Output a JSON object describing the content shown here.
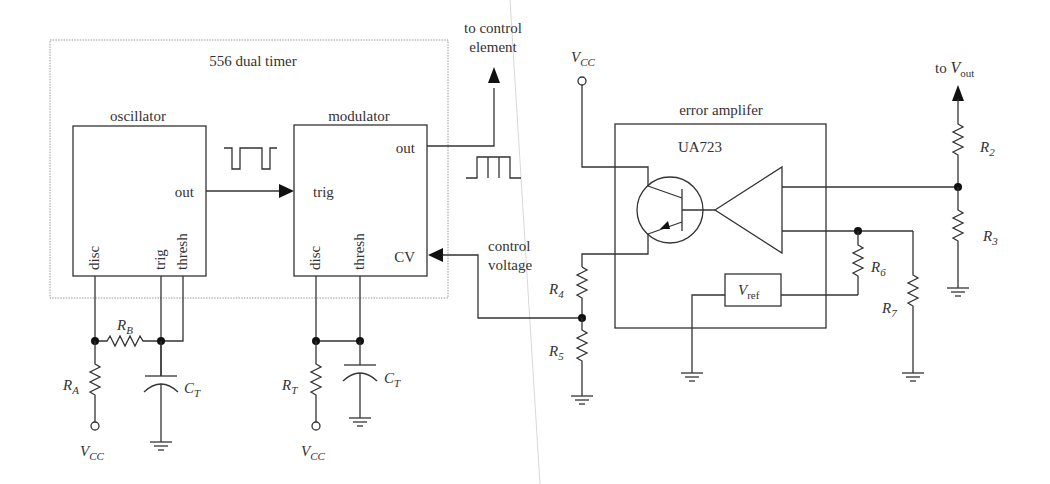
{
  "diagram": {
    "title": "556 dual timer",
    "blocks": {
      "oscillator": {
        "label": "oscillator",
        "pins": {
          "out": "out",
          "disc": "disc",
          "trig": "trig",
          "thresh": "thresh"
        }
      },
      "modulator": {
        "label": "modulator",
        "pins": {
          "out": "out",
          "trig": "trig",
          "disc": "disc",
          "thresh": "thresh",
          "cv": "CV"
        }
      },
      "error_amplifier": {
        "label": "error amplifer",
        "chip": "UA723",
        "vref": {
          "main": "V",
          "sub": "ref"
        }
      }
    },
    "annotations": {
      "to_control_line1": "to control",
      "to_control_line2": "element",
      "control_voltage_line1": "control",
      "control_voltage_line2": "voltage",
      "to_vout_prefix": "to",
      "vout_main": "V",
      "vout_sub": "out"
    },
    "components": {
      "RA": {
        "main": "R",
        "sub": "A"
      },
      "RB": {
        "main": "R",
        "sub": "B"
      },
      "CT1": {
        "main": "C",
        "sub": "T"
      },
      "RT": {
        "main": "R",
        "sub": "T"
      },
      "CT2": {
        "main": "C",
        "sub": "T"
      },
      "R2": {
        "main": "R",
        "sub": "2"
      },
      "R3": {
        "main": "R",
        "sub": "3"
      },
      "R4": {
        "main": "R",
        "sub": "4"
      },
      "R5": {
        "main": "R",
        "sub": "5"
      },
      "R6": {
        "main": "R",
        "sub": "6"
      },
      "R7": {
        "main": "R",
        "sub": "7"
      }
    },
    "supplies": {
      "vcc_osc": {
        "main": "V",
        "sub": "CC"
      },
      "vcc_mod": {
        "main": "V",
        "sub": "CC"
      },
      "vcc_amp": {
        "main": "V",
        "sub": "CC"
      }
    },
    "colors": {
      "line": "#333333",
      "dotted_border": "#999999",
      "background": "#ffffff"
    }
  }
}
